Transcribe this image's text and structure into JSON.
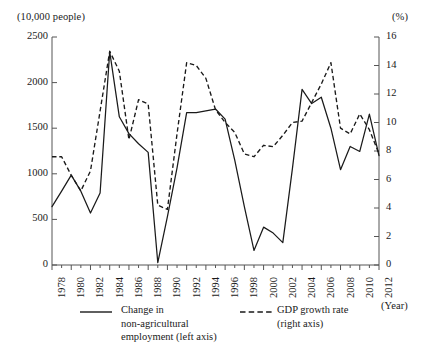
{
  "chart_data": {
    "type": "line",
    "title": "",
    "subtitle": "",
    "xlabel": "(Year)",
    "ylabel": "(10,000 people)",
    "y2label": "(%)",
    "xlim": [
      1978,
      2012
    ],
    "ylim": [
      0,
      2500
    ],
    "y2lim": [
      0,
      16
    ],
    "grid": false,
    "legend_position": "bottom",
    "x": [
      1978,
      1979,
      1980,
      1981,
      1982,
      1983,
      1984,
      1985,
      1986,
      1987,
      1988,
      1989,
      1990,
      1991,
      1992,
      1993,
      1994,
      1995,
      1996,
      1997,
      1998,
      1999,
      2000,
      2001,
      2002,
      2003,
      2004,
      2005,
      2006,
      2007,
      2008,
      2009,
      2010,
      2011,
      2012
    ],
    "x_tick_labels": [
      "1978",
      "1980",
      "1982",
      "1984",
      "1986",
      "1988",
      "1990",
      "1992",
      "1994",
      "1996",
      "1998",
      "2000",
      "2002",
      "2004",
      "2006",
      "2008",
      "2010",
      "2012"
    ],
    "y_tick_labels": [
      "0",
      "500",
      "1000",
      "1500",
      "2000",
      "2500"
    ],
    "y_ticks": [
      0,
      500,
      1000,
      1500,
      2000,
      2500
    ],
    "y2_tick_labels": [
      "0",
      "2",
      "4",
      "6",
      "8",
      "10",
      "12",
      "14",
      "16"
    ],
    "y2_ticks": [
      0,
      2,
      4,
      6,
      8,
      10,
      12,
      14,
      16
    ],
    "series": [
      {
        "name": "Change in non-agricultural employment (left axis)",
        "axis": "left",
        "style": "solid",
        "color": "#1a1a1a",
        "units": "10,000 people",
        "values": [
          640,
          810,
          985,
          810,
          570,
          790,
          2340,
          1625,
          1440,
          1330,
          1235,
          25,
          530,
          1065,
          1670,
          1670,
          1690,
          1710,
          1600,
          1150,
          640,
          160,
          415,
          350,
          245,
          1060,
          1925,
          1770,
          1840,
          1500,
          1045,
          1300,
          1245,
          1655,
          1200
        ]
      },
      {
        "name": "GDP growth rate (right axis)",
        "axis": "right",
        "style": "dashed",
        "color": "#1a1a1a",
        "units": "%",
        "values": [
          7.6,
          7.6,
          6.3,
          5.2,
          6.6,
          10.8,
          15.0,
          13.6,
          8.8,
          11.6,
          11.3,
          4.2,
          3.9,
          9.2,
          14.2,
          14.0,
          13.1,
          10.9,
          10.0,
          9.3,
          7.8,
          7.6,
          8.4,
          8.3,
          9.1,
          10.0,
          10.1,
          11.4,
          12.7,
          14.2,
          9.6,
          9.2,
          10.6,
          9.5,
          7.8
        ]
      }
    ]
  },
  "legend": {
    "solid_label": "Change in\nnon-agricultural\nemployment (left axis)",
    "solid_line1": "Change in",
    "solid_line2": "non-agricultural",
    "solid_line3": "employment (left axis)",
    "dashed_line1": "GDP growth rate",
    "dashed_line2": "(right axis)"
  }
}
